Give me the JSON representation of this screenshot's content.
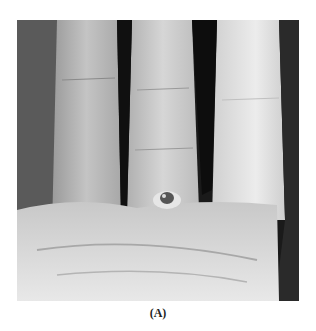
{
  "figure": {
    "panel_label": "(A)",
    "image_description": "Grayscale clinical photograph of a palm and fingers with a lesion at the base of a finger"
  }
}
